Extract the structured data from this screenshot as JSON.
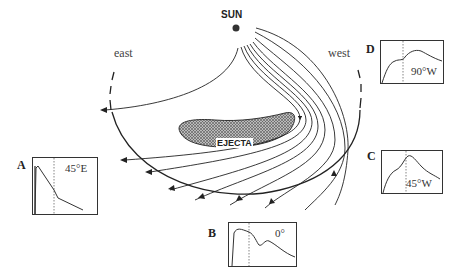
{
  "diagram": {
    "sun_label": "SUN",
    "east_label": "east",
    "west_label": "west",
    "ejecta_label": "EJECTA"
  },
  "panels": [
    {
      "letter": "A",
      "angle": "45°E",
      "y_ticks": [
        "0",
        "-1",
        "-2",
        "-3",
        "-4"
      ],
      "profile": "sharp rise then steady decline"
    },
    {
      "letter": "B",
      "angle": "0°",
      "y_ticks": [
        "0",
        "-1",
        "-2",
        "-3",
        "-4"
      ],
      "profile": "rise, plateau, dip, secondary bump, decline"
    },
    {
      "letter": "C",
      "angle": "45°W",
      "y_ticks": [
        "0",
        "-1",
        "-2",
        "-3",
        "-4"
      ],
      "profile": "gradual rise to peak at dashed line then decline"
    },
    {
      "letter": "D",
      "angle": "90°W",
      "y_ticks": [
        "0",
        "-1",
        "-2",
        "-3",
        "-4"
      ],
      "profile": "rise, shoulder, broad peak after dashed line, slow decline"
    }
  ]
}
